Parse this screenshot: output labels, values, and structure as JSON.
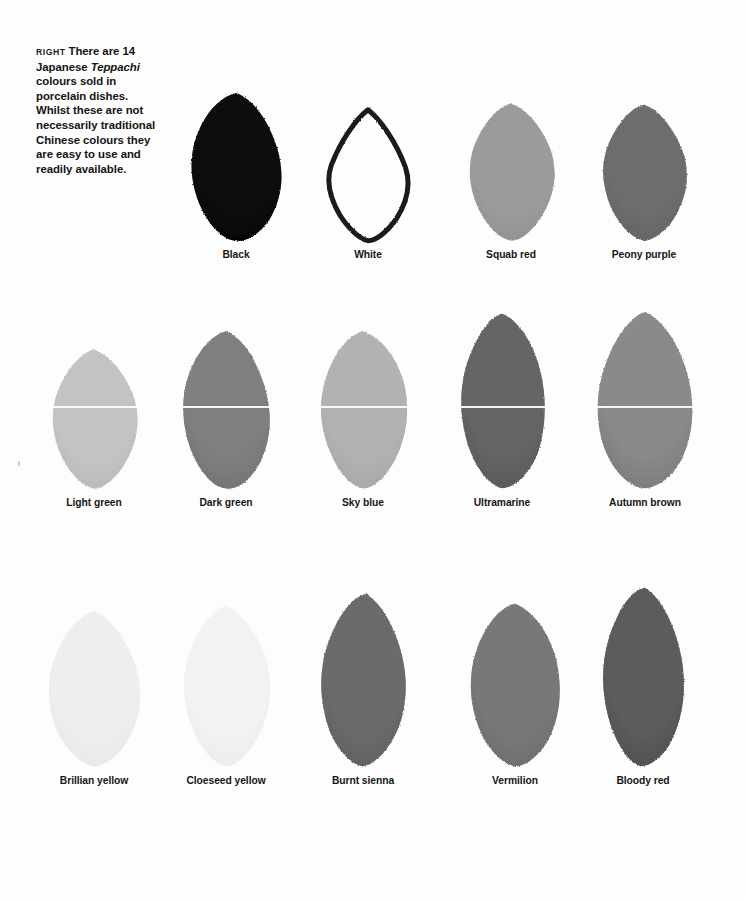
{
  "caption": {
    "kicker": "RIGHT",
    "line_1": "There are 14",
    "line_2_pre": "Japanese ",
    "line_2_italic": "Teppachi",
    "body": "colours sold in porcelain dishes. Whilst these are not necessarily traditional Chinese colours they are easy to use and readily available.",
    "full_text": "RIGHT There are 14 Japanese Teppachi colours sold in porcelain dishes. Whilst these are not necessarily traditional Chinese colours they are easy to use and readily available."
  },
  "plate": {
    "total_colours": 14,
    "rows": [
      {
        "index": 1,
        "swatches": [
          {
            "label": "Black",
            "fill": "#0e0d0c",
            "edge": "#000000",
            "style": "solid",
            "shape": "leaf-a",
            "w": 108,
            "h": 152
          },
          {
            "label": "White",
            "fill": "#ffffff",
            "edge": "#1b1a19",
            "style": "outline",
            "shape": "leaf-b",
            "w": 94,
            "h": 135
          },
          {
            "label": "Squab red",
            "fill": "#9b9b9b",
            "edge": "#8d8d8d",
            "style": "solid",
            "shape": "leaf-c",
            "w": 100,
            "h": 140
          },
          {
            "label": "Peony purple",
            "fill": "#6d6d6d",
            "edge": "#606060",
            "style": "solid",
            "shape": "leaf-d",
            "w": 100,
            "h": 140
          }
        ]
      },
      {
        "index": 2,
        "swatches": [
          {
            "label": "Light green",
            "fill": "#c3c3c2",
            "edge": "#b6b6b5",
            "style": "solid",
            "shape": "leaf-c",
            "w": 100,
            "h": 142
          },
          {
            "label": "Dark green",
            "fill": "#7f7f7e",
            "edge": "#6f6f6e",
            "style": "solid",
            "shape": "leaf-a",
            "w": 104,
            "h": 162
          },
          {
            "label": "Sky blue",
            "fill": "#b2b2b2",
            "edge": "#a3a3a3",
            "style": "solid",
            "shape": "leaf-e",
            "w": 100,
            "h": 160
          },
          {
            "label": "Ultramarine",
            "fill": "#656565",
            "edge": "#565656",
            "style": "solid",
            "shape": "leaf-f",
            "w": 98,
            "h": 178
          },
          {
            "label": "Autumn brown",
            "fill": "#8a8a89",
            "edge": "#767675",
            "style": "solid",
            "shape": "leaf-g",
            "w": 108,
            "h": 180
          }
        ]
      },
      {
        "index": 3,
        "swatches": [
          {
            "label": "Brillian yellow",
            "fill": "#eeeeed",
            "edge": "#e6e6e5",
            "style": "solid",
            "shape": "leaf-h",
            "w": 108,
            "h": 160
          },
          {
            "label": "Cloeseed yellow",
            "fill": "#f2f2f1",
            "edge": "#eaeae9",
            "style": "solid",
            "shape": "leaf-c",
            "w": 102,
            "h": 164
          },
          {
            "label": "Burnt sienna",
            "fill": "#6b6b6a",
            "edge": "#5c5c5b",
            "style": "solid",
            "shape": "leaf-i",
            "w": 102,
            "h": 176
          },
          {
            "label": "Vermilion",
            "fill": "#787877",
            "edge": "#696968",
            "style": "solid",
            "shape": "leaf-j",
            "w": 104,
            "h": 166
          },
          {
            "label": "Bloody red",
            "fill": "#5c5c5b",
            "edge": "#4c4c4b",
            "style": "solid",
            "shape": "leaf-k",
            "w": 98,
            "h": 182
          }
        ]
      }
    ]
  }
}
